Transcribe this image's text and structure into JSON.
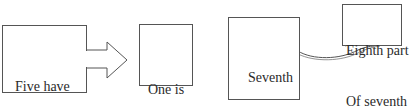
{
  "diagram": {
    "nodes": [
      {
        "id": "five-have-fallen",
        "lines": [
          "Five have",
          "fallen"
        ]
      },
      {
        "id": "one-is",
        "lines": [
          "One is"
        ]
      },
      {
        "id": "seventh-yet-to-come",
        "lines": [
          "Seventh",
          "yet to",
          "come"
        ]
      },
      {
        "id": "eighth-part",
        "lines": [
          "Eighth part",
          "Of seventh"
        ]
      }
    ],
    "edges": [
      {
        "from": "five-have-fallen",
        "to": "one-is",
        "style": "block-arrow"
      },
      {
        "from": "seventh-yet-to-come",
        "to": "eighth-part",
        "style": "curved-arrow"
      }
    ]
  }
}
